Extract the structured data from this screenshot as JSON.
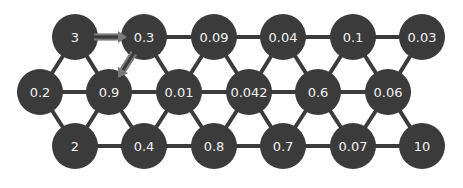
{
  "diagram": {
    "type": "hexagonal-lattice-graph",
    "colors": {
      "background": "#ffffff",
      "node_fill": "#3b3b3b",
      "node_text": "#f2f2f2",
      "edge": "#3b3b3b",
      "arrow": "#7a7a7a"
    },
    "node_radius": 23,
    "nodes": [
      {
        "id": "t0",
        "label": "3",
        "x": 75,
        "y": 37
      },
      {
        "id": "t1",
        "label": "0.3",
        "x": 144,
        "y": 37
      },
      {
        "id": "t2",
        "label": "0.09",
        "x": 214,
        "y": 37
      },
      {
        "id": "t3",
        "label": "0.04",
        "x": 283,
        "y": 37
      },
      {
        "id": "t4",
        "label": "0.1",
        "x": 353,
        "y": 37
      },
      {
        "id": "t5",
        "label": "0.03",
        "x": 422,
        "y": 37
      },
      {
        "id": "m0",
        "label": "0.2",
        "x": 40,
        "y": 92
      },
      {
        "id": "m1",
        "label": "0.9",
        "x": 109,
        "y": 92
      },
      {
        "id": "m2",
        "label": "0.01",
        "x": 179,
        "y": 92
      },
      {
        "id": "m3",
        "label": "0.042",
        "x": 249,
        "y": 92
      },
      {
        "id": "m4",
        "label": "0.6",
        "x": 318,
        "y": 92
      },
      {
        "id": "m5",
        "label": "0.06",
        "x": 388,
        "y": 92
      },
      {
        "id": "b0",
        "label": "2",
        "x": 75,
        "y": 146
      },
      {
        "id": "b1",
        "label": "0.4",
        "x": 144,
        "y": 146
      },
      {
        "id": "b2",
        "label": "0.8",
        "x": 214,
        "y": 146
      },
      {
        "id": "b3",
        "label": "0.7",
        "x": 283,
        "y": 146
      },
      {
        "id": "b4",
        "label": "0.07",
        "x": 353,
        "y": 146
      },
      {
        "id": "b5",
        "label": "10",
        "x": 422,
        "y": 146
      }
    ],
    "edges": [
      [
        "t0",
        "t1"
      ],
      [
        "t1",
        "t2"
      ],
      [
        "t2",
        "t3"
      ],
      [
        "t3",
        "t4"
      ],
      [
        "t4",
        "t5"
      ],
      [
        "m0",
        "m1"
      ],
      [
        "m1",
        "m2"
      ],
      [
        "m2",
        "m3"
      ],
      [
        "m3",
        "m4"
      ],
      [
        "m4",
        "m5"
      ],
      [
        "b0",
        "b1"
      ],
      [
        "b1",
        "b2"
      ],
      [
        "b2",
        "b3"
      ],
      [
        "b3",
        "b4"
      ],
      [
        "b4",
        "b5"
      ],
      [
        "t0",
        "m0"
      ],
      [
        "t0",
        "m1"
      ],
      [
        "t1",
        "m1"
      ],
      [
        "t1",
        "m2"
      ],
      [
        "t2",
        "m2"
      ],
      [
        "t2",
        "m3"
      ],
      [
        "t3",
        "m3"
      ],
      [
        "t3",
        "m4"
      ],
      [
        "t4",
        "m4"
      ],
      [
        "t4",
        "m5"
      ],
      [
        "t5",
        "m5"
      ],
      [
        "b0",
        "m0"
      ],
      [
        "b0",
        "m1"
      ],
      [
        "b1",
        "m1"
      ],
      [
        "b1",
        "m2"
      ],
      [
        "b2",
        "m2"
      ],
      [
        "b2",
        "m3"
      ],
      [
        "b3",
        "m3"
      ],
      [
        "b3",
        "m4"
      ],
      [
        "b4",
        "m4"
      ],
      [
        "b4",
        "m5"
      ],
      [
        "b5",
        "m5"
      ]
    ],
    "arrows": [
      {
        "from": "t0",
        "to": "t1",
        "style": "double-line"
      },
      {
        "from": "t1",
        "to": "m1",
        "style": "double-line"
      }
    ]
  }
}
